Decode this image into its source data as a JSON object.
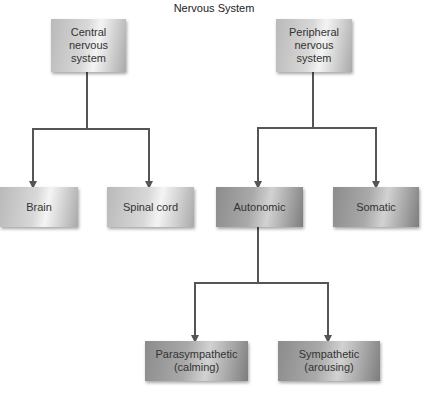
{
  "title": "Nervous System",
  "nodes": {
    "central": "Central nervous system",
    "peripheral": "Peripheral nervous system",
    "brain": "Brain",
    "spinal_cord": "Spinal cord",
    "autonomic": "Autonomic",
    "somatic": "Somatic",
    "parasympathetic": "Parasympathetic (calming)",
    "sympathetic": "Sympathetic (arousing)"
  },
  "edges": [
    [
      "central",
      "brain"
    ],
    [
      "central",
      "spinal_cord"
    ],
    [
      "peripheral",
      "autonomic"
    ],
    [
      "peripheral",
      "somatic"
    ],
    [
      "autonomic",
      "parasympathetic"
    ],
    [
      "autonomic",
      "sympathetic"
    ]
  ],
  "colors": {
    "line": "#555555",
    "light_box": "#d0d0d0",
    "dark_box": "#a0a0a0"
  }
}
